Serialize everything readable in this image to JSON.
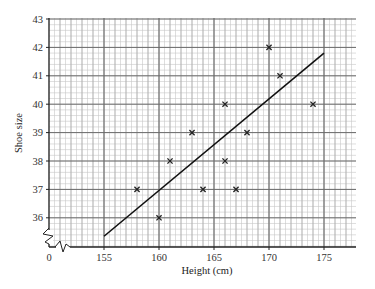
{
  "chart_data": {
    "type": "scatter",
    "title": "",
    "xlabel": "Height (cm)",
    "ylabel": "Shoe size",
    "xlim": [
      150,
      178
    ],
    "ylim": [
      35,
      43
    ],
    "x_axis_break": true,
    "y_axis_break": true,
    "x_origin_label": "0",
    "x_ticks": [
      155,
      160,
      165,
      170,
      175
    ],
    "x_tick_labels": [
      "155",
      "160",
      "165",
      "170",
      "175"
    ],
    "y_ticks": [
      36,
      37,
      38,
      39,
      40,
      41,
      42,
      43
    ],
    "y_tick_labels": [
      "36",
      "37",
      "38",
      "39",
      "40",
      "41",
      "42",
      "43"
    ],
    "grid": true,
    "grid_minor_x_step": 0.5,
    "grid_minor_y_step": 0.2,
    "marker": "x",
    "legend": null,
    "series": [
      {
        "name": "Data",
        "points": [
          {
            "x": 158,
            "y": 37
          },
          {
            "x": 160,
            "y": 36
          },
          {
            "x": 161,
            "y": 38
          },
          {
            "x": 163,
            "y": 39
          },
          {
            "x": 164,
            "y": 37
          },
          {
            "x": 166,
            "y": 38
          },
          {
            "x": 166,
            "y": 40
          },
          {
            "x": 167,
            "y": 37
          },
          {
            "x": 168,
            "y": 39
          },
          {
            "x": 170,
            "y": 42
          },
          {
            "x": 171,
            "y": 41
          },
          {
            "x": 174,
            "y": 40
          }
        ]
      }
    ],
    "line_of_best_fit": {
      "start": {
        "x": 155,
        "y": 35.35
      },
      "end": {
        "x": 175,
        "y": 41.8
      }
    }
  },
  "colors": {
    "grid_minor": "#c8c8c8",
    "grid_major": "#6a6a6a",
    "axis": "#222222",
    "marker": "#222222",
    "fit_line": "#111111"
  }
}
